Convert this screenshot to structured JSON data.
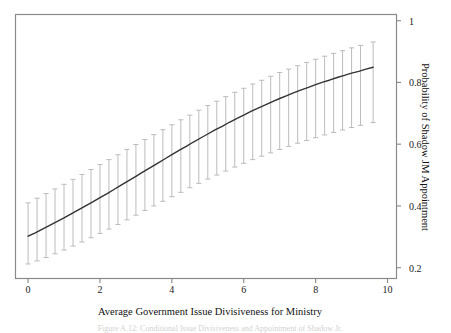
{
  "chart_data": {
    "type": "line",
    "title": "",
    "xlabel": "Average Government Issue Divisiveness for Ministry",
    "ylabel": "Probability of Shadow JM Appointment",
    "xlim": [
      -0.35,
      10.25
    ],
    "ylim": [
      0.165,
      1.02
    ],
    "grid": false,
    "legend": null,
    "xticks": [
      0,
      2,
      4,
      6,
      8,
      10
    ],
    "xtick_labels": [
      "0",
      "2",
      "4",
      "6",
      "8",
      "10"
    ],
    "yticks": [
      0.2,
      0.4,
      0.6,
      0.8,
      1
    ],
    "ytick_labels": [
      "0.2",
      "0.4",
      "0.6",
      "0.8",
      "1"
    ],
    "y_axis_side": "right",
    "series": [
      {
        "name": "Predicted probability",
        "type": "line",
        "color": "#333333",
        "x": [
          0.0,
          0.2,
          0.4,
          0.6,
          0.8,
          1.0,
          1.2,
          1.4,
          1.6,
          1.8,
          2.0,
          2.2,
          2.4,
          2.6,
          2.8,
          3.0,
          3.2,
          3.4,
          3.6,
          3.8,
          4.0,
          4.2,
          4.4,
          4.6,
          4.8,
          5.0,
          5.2,
          5.4,
          5.6,
          5.8,
          6.0,
          6.2,
          6.4,
          6.6,
          6.8,
          7.0,
          7.2,
          7.4,
          7.6,
          7.8,
          8.0,
          8.2,
          8.4,
          8.6,
          8.8,
          9.0,
          9.2,
          9.4,
          9.6
        ],
        "y": [
          0.302,
          0.313,
          0.325,
          0.337,
          0.349,
          0.361,
          0.374,
          0.387,
          0.4,
          0.413,
          0.427,
          0.44,
          0.454,
          0.468,
          0.482,
          0.496,
          0.51,
          0.524,
          0.538,
          0.552,
          0.566,
          0.58,
          0.593,
          0.607,
          0.62,
          0.633,
          0.646,
          0.658,
          0.671,
          0.683,
          0.694,
          0.706,
          0.717,
          0.727,
          0.738,
          0.748,
          0.757,
          0.767,
          0.776,
          0.784,
          0.793,
          0.801,
          0.808,
          0.816,
          0.823,
          0.83,
          0.836,
          0.843,
          0.849
        ]
      },
      {
        "name": "95% confidence interval",
        "type": "errorbar",
        "color": "#b4b4b4",
        "x": [
          0.0,
          0.25,
          0.5,
          0.75,
          1.0,
          1.25,
          1.5,
          1.75,
          2.0,
          2.25,
          2.5,
          2.75,
          3.0,
          3.25,
          3.5,
          3.75,
          4.0,
          4.25,
          4.5,
          4.75,
          5.0,
          5.25,
          5.5,
          5.75,
          6.0,
          6.25,
          6.5,
          6.75,
          7.0,
          7.25,
          7.5,
          7.75,
          8.0,
          8.25,
          8.5,
          8.75,
          9.0,
          9.25,
          9.6
        ],
        "lower": [
          0.212,
          0.222,
          0.233,
          0.245,
          0.257,
          0.27,
          0.283,
          0.297,
          0.311,
          0.325,
          0.34,
          0.355,
          0.37,
          0.385,
          0.4,
          0.415,
          0.43,
          0.444,
          0.459,
          0.473,
          0.487,
          0.5,
          0.513,
          0.526,
          0.538,
          0.55,
          0.561,
          0.572,
          0.583,
          0.593,
          0.603,
          0.612,
          0.621,
          0.63,
          0.638,
          0.646,
          0.654,
          0.661,
          0.67
        ],
        "upper": [
          0.41,
          0.425,
          0.44,
          0.455,
          0.47,
          0.486,
          0.502,
          0.518,
          0.534,
          0.55,
          0.566,
          0.583,
          0.599,
          0.615,
          0.631,
          0.647,
          0.663,
          0.679,
          0.694,
          0.71,
          0.725,
          0.739,
          0.754,
          0.768,
          0.781,
          0.795,
          0.807,
          0.82,
          0.832,
          0.843,
          0.854,
          0.865,
          0.875,
          0.885,
          0.894,
          0.903,
          0.912,
          0.92,
          0.931
        ]
      }
    ]
  },
  "caption": {
    "text": "Figure A.12: Conditional Issue Divisiveness and Appointment of Shadow Jr."
  },
  "axes": {
    "frame_color": "#888888"
  }
}
